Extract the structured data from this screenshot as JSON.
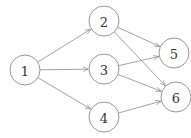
{
  "diagram": {
    "type": "directed-graph",
    "nodes": [
      {
        "id": "1",
        "label": "1",
        "x": 25,
        "y": 70
      },
      {
        "id": "2",
        "label": "2",
        "x": 104,
        "y": 21
      },
      {
        "id": "3",
        "label": "3",
        "x": 104,
        "y": 69
      },
      {
        "id": "4",
        "label": "4",
        "x": 104,
        "y": 117
      },
      {
        "id": "5",
        "label": "5",
        "x": 174,
        "y": 53
      },
      {
        "id": "6",
        "label": "6",
        "x": 176,
        "y": 97
      }
    ],
    "edges": [
      {
        "from": "1",
        "to": "2"
      },
      {
        "from": "1",
        "to": "3"
      },
      {
        "from": "1",
        "to": "4"
      },
      {
        "from": "2",
        "to": "5"
      },
      {
        "from": "2",
        "to": "6"
      },
      {
        "from": "3",
        "to": "5"
      },
      {
        "from": "3",
        "to": "6"
      },
      {
        "from": "4",
        "to": "6"
      }
    ],
    "radius": 15
  }
}
